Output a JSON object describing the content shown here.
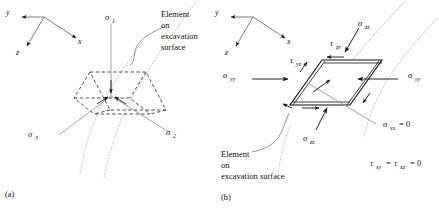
{
  "figure": {
    "panel_a": {
      "caption": "(a)",
      "axes": {
        "x": "x",
        "y": "y",
        "z": "z"
      },
      "stress_labels": {
        "sigma1": "σ",
        "sigma1_sub": "1",
        "sigma2": "σ",
        "sigma2_sub": "2",
        "sigma3": "σ",
        "sigma3_sub": "3"
      },
      "annotation": {
        "line1": "Element",
        "line2": "on",
        "line3": "excavation",
        "line4": "surface"
      }
    },
    "panel_b": {
      "caption": "(b)",
      "axes": {
        "x": "x",
        "y": "y",
        "z": "z"
      },
      "stress_labels": {
        "sigma_zz_top": "σ",
        "sigma_zz_top_sub": "zz",
        "tau_zy": "τ",
        "tau_zy_sub": "zy",
        "tau_yz": "τ",
        "tau_yz_sub": "yz",
        "sigma_yy_left": "σ",
        "sigma_yy_left_sub": "yy",
        "sigma_yy_right": "σ",
        "sigma_yy_right_sub": "yy",
        "sigma_zz_bottom": "σ",
        "sigma_zz_bottom_sub": "zz",
        "sigma_xx_zero": "σ",
        "sigma_xx_zero_sub": "xx",
        "sigma_xx_zero_rhs": "= 0"
      },
      "equation": {
        "tau1": "τ",
        "tau1_sub": "xy",
        "eq1": "=",
        "tau2": "τ",
        "tau2_sub": "xz",
        "eq2": "= 0"
      },
      "annotation": {
        "line1": "Element",
        "line2": "on",
        "line3": "excavation surface"
      }
    },
    "colors": {
      "ink": "#111111",
      "surface_dotted": "#c9c9c9",
      "axis_gray": "#8d8d8d",
      "element_dashed": "#2b2b2b"
    }
  }
}
